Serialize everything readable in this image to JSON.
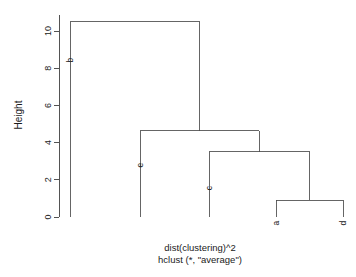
{
  "chart_data": {
    "type": "dendrogram",
    "title": "",
    "xlabel": "dist(clustering)^2",
    "sublabel": "hclust (*, \"average\")",
    "ylabel": "Height",
    "ylim": [
      0,
      10.8
    ],
    "yticks": [
      0,
      2,
      4,
      6,
      8,
      10
    ],
    "ytick_labels": [
      "0",
      "2",
      "4",
      "6",
      "8",
      "10"
    ],
    "grid": false,
    "legend": "none",
    "leaf_order": [
      "b",
      "e",
      "c",
      "a",
      "d"
    ],
    "leaves": [
      {
        "label": "b",
        "x": 70
      },
      {
        "label": "e",
        "x": 140
      },
      {
        "label": "c",
        "x": 209
      },
      {
        "label": "a",
        "x": 276
      },
      {
        "label": "d",
        "x": 343
      }
    ],
    "merges": [
      {
        "id": "m1",
        "left": "a",
        "right": "d",
        "height": 0.9
      },
      {
        "id": "m2",
        "left": "c",
        "right": "m1",
        "height": 3.5
      },
      {
        "id": "m3",
        "left": "e",
        "right": "m2",
        "height": 4.65
      },
      {
        "id": "m4",
        "left": "b",
        "right": "m3",
        "height": 10.5
      }
    ],
    "link_color": "#4a4a4a",
    "axis_color": "#404040"
  },
  "caption": {
    "line1": "dist(clustering)^2",
    "line2": "hclust (*, \"average\")"
  },
  "axis": {
    "y_title": "Height"
  }
}
